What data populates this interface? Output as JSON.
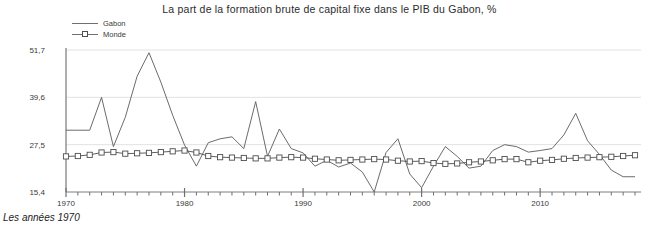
{
  "chart_data": {
    "type": "line",
    "title": "La part de la formation brute de capital fixe dans le PIB du Gabon, %",
    "caption": "Les années 1970",
    "xlabel": "",
    "ylabel": "",
    "grid": true,
    "legend_position": "top-left",
    "xlim": [
      1970,
      2018
    ],
    "ylim": [
      15.4,
      51.7
    ],
    "ytick_labels": [
      "51,7",
      "39,6",
      "27,5",
      "15,4"
    ],
    "ytick_values": [
      51.7,
      39.6,
      27.5,
      15.4
    ],
    "xtick_labels": [
      "1970",
      "1980",
      "1990",
      "2000",
      "2010"
    ],
    "xtick_values": [
      1970,
      1980,
      1990,
      2000,
      2010
    ],
    "minor_xticks_every": 1,
    "x": [
      1970,
      1971,
      1972,
      1973,
      1974,
      1975,
      1976,
      1977,
      1978,
      1979,
      1980,
      1981,
      1982,
      1983,
      1984,
      1985,
      1986,
      1987,
      1988,
      1989,
      1990,
      1991,
      1992,
      1993,
      1994,
      1995,
      1996,
      1997,
      1998,
      1999,
      2000,
      2001,
      2002,
      2003,
      2004,
      2005,
      2006,
      2007,
      2008,
      2009,
      2010,
      2011,
      2012,
      2013,
      2014,
      2015,
      2016,
      2017,
      2018
    ],
    "series": [
      {
        "name": "Gabon",
        "color": "#5a5a5a",
        "marker": "none",
        "values": [
          31.2,
          31.2,
          31.2,
          39.6,
          27.0,
          34.5,
          45.0,
          51.0,
          43.5,
          35.0,
          27.4,
          22.0,
          28.0,
          29.0,
          29.5,
          26.5,
          38.5,
          24.5,
          31.5,
          26.5,
          25.4,
          22.0,
          23.5,
          21.8,
          22.8,
          20.5,
          15.4,
          25.5,
          29.0,
          20.0,
          16.5,
          22.0,
          27.0,
          24.5,
          21.5,
          22.0,
          26.0,
          27.5,
          27.0,
          25.6,
          26.0,
          26.5,
          30.0,
          35.5,
          28.5,
          25.0,
          21.0,
          19.3,
          19.3
        ]
      },
      {
        "name": "Monde",
        "color": "#4d4d4d",
        "marker": "square",
        "values": [
          24.5,
          24.6,
          24.9,
          25.5,
          25.6,
          25.2,
          25.3,
          25.4,
          25.6,
          25.8,
          26.0,
          25.5,
          24.6,
          24.3,
          24.2,
          24.1,
          24.0,
          24.0,
          24.2,
          24.3,
          24.2,
          23.9,
          23.7,
          23.5,
          23.6,
          23.7,
          23.8,
          23.7,
          23.4,
          23.2,
          23.3,
          22.8,
          22.6,
          22.7,
          23.0,
          23.2,
          23.5,
          23.8,
          23.8,
          23.0,
          23.4,
          23.6,
          23.9,
          24.1,
          24.2,
          24.3,
          24.4,
          24.6,
          24.8
        ]
      }
    ]
  },
  "legend": {
    "items": [
      {
        "label": "Gabon",
        "marker": "line"
      },
      {
        "label": "Monde",
        "marker": "line-square"
      }
    ]
  }
}
